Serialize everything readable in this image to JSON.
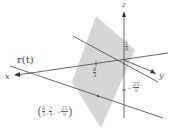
{
  "diagram": {
    "axes": {
      "x_label": "x",
      "y_label": "y",
      "z_label": "z"
    },
    "curve_label": "r(t)",
    "ticks": {
      "x": {
        "num": "8",
        "den": "3"
      },
      "y": {
        "num": "1",
        "den": "9"
      },
      "z": {
        "sign": "−",
        "num": "25",
        "den": "9"
      }
    },
    "point_label": {
      "open": "(",
      "x_num": "8",
      "x_den": "3",
      "y_num": "1",
      "y_den": "9",
      "z_sign": "−",
      "z_num": "25",
      "z_den": "9",
      "sep": ",",
      "close": ")"
    },
    "colors": {
      "plane": "#cfcfcf",
      "axis": "#555555",
      "line": "#555555"
    }
  }
}
